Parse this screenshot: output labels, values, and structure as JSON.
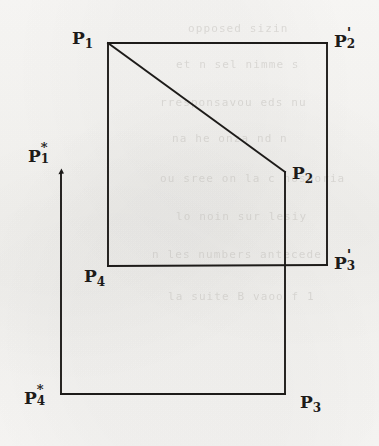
{
  "figure": {
    "background_color": "#f7f6f4",
    "ink_color": "#1d1b19",
    "width": 379,
    "height": 446
  },
  "labels": [
    {
      "id": "p1",
      "base": "P",
      "sub": "1",
      "sup": "",
      "prime": "",
      "text": "P1",
      "x": 72,
      "y": 30
    },
    {
      "id": "p2prime",
      "base": "P",
      "sub": "2",
      "sup": "",
      "prime": "'",
      "text": "P2'",
      "x": 334,
      "y": 30
    },
    {
      "id": "p2",
      "base": "P",
      "sub": "2",
      "sup": "",
      "prime": "",
      "text": "P2",
      "x": 292,
      "y": 165
    },
    {
      "id": "p1star",
      "base": "P",
      "sub": "1",
      "sup": "*",
      "prime": "",
      "text": "P1*",
      "x": 28,
      "y": 145
    },
    {
      "id": "p4",
      "base": "P",
      "sub": "4",
      "sup": "",
      "prime": "",
      "text": "P4",
      "x": 84,
      "y": 268
    },
    {
      "id": "p3prime",
      "base": "P",
      "sub": "3",
      "sup": "",
      "prime": "'",
      "text": "P3'",
      "x": 334,
      "y": 252
    },
    {
      "id": "p4star",
      "base": "P",
      "sub": "4",
      "sup": "*",
      "prime": "",
      "text": "P4*",
      "x": 24,
      "y": 387
    },
    {
      "id": "p3",
      "base": "P",
      "sub": "3",
      "sup": "",
      "prime": "",
      "text": "P3",
      "x": 300,
      "y": 394
    }
  ],
  "geometry": {
    "vertices": {
      "p1": {
        "x": 108,
        "y": 43
      },
      "p2prime": {
        "x": 327,
        "y": 43
      },
      "p2": {
        "x": 285,
        "y": 172
      },
      "p3prime": {
        "x": 327,
        "y": 265
      },
      "p4": {
        "x": 108,
        "y": 266
      },
      "p1star": {
        "x": 61,
        "y": 172
      },
      "p4star": {
        "x": 61,
        "y": 394
      },
      "p3": {
        "x": 285,
        "y": 394
      }
    },
    "segments": [
      {
        "name": "top-edge",
        "from": "p1",
        "to": "p2prime"
      },
      {
        "name": "right-edge-upper",
        "from": "p2prime",
        "to": "p3prime"
      },
      {
        "name": "bottom-edge-inner",
        "from": "p4",
        "to": "p3prime"
      },
      {
        "name": "left-edge-inner",
        "from": "p1",
        "to": "p4"
      },
      {
        "name": "diagonal",
        "from": "p1",
        "to": "p2"
      },
      {
        "name": "p2-vertical",
        "from": "p2",
        "to": "p3"
      },
      {
        "name": "star-vertical",
        "from": "p1star",
        "to": "p4star"
      },
      {
        "name": "star-bottom",
        "from": "p4star",
        "to": "p3"
      }
    ],
    "tick_marker": {
      "name": "p1star-tick",
      "x": 61,
      "y": 172
    }
  },
  "ghost_text": {
    "note": "faint show-through text from reverse of page",
    "lines": [
      {
        "text": "opposed sizin",
        "x": 188,
        "y": 22
      },
      {
        "text": "et n sel nimme s",
        "x": 176,
        "y": 58
      },
      {
        "text": "rresponsavou eds nu",
        "x": 160,
        "y": 96
      },
      {
        "text": "na he onza nd n",
        "x": 172,
        "y": 132
      },
      {
        "text": "ou sree on la c nosporia",
        "x": 160,
        "y": 172
      },
      {
        "text": "lo noin sur lesiy",
        "x": 176,
        "y": 210
      },
      {
        "text": "n    les numbers antecede",
        "x": 152,
        "y": 248
      },
      {
        "text": "la suite B vaoo f 1",
        "x": 168,
        "y": 290
      }
    ]
  }
}
